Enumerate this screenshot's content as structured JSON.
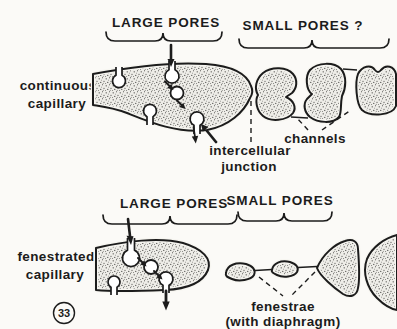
{
  "figure": {
    "number": "33",
    "colors": {
      "ink": "#1c1c1c",
      "background": "#fbfaf7",
      "cell_fill": "#eeede8"
    }
  },
  "top_row": {
    "side_label": [
      "continuous",
      "capillary"
    ],
    "brace_large_label": "LARGE PORES",
    "brace_small_label": "SMALL PORES ?",
    "junction_label": [
      "intercellular",
      "junction"
    ],
    "channels_label": "channels"
  },
  "bottom_row": {
    "side_label": [
      "fenestrated",
      "capillary"
    ],
    "brace_large_label": "LARGE PORES",
    "brace_small_label": "SMALL PORES",
    "fenestrae_label": [
      "fenestrae",
      "(with diaphragm)"
    ]
  }
}
